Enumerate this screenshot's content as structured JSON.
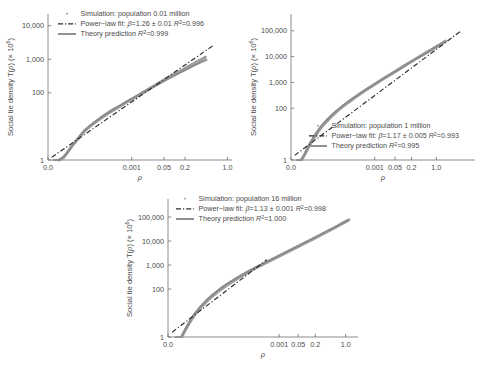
{
  "figure": {
    "background": "#ffffff",
    "series_color": "#8c8c8c",
    "fit_color": "#2b2b2b",
    "axis_color": "#6e6e6e"
  },
  "common": {
    "xlabel": "ρ",
    "ylabel_main": "Social tie density T(",
    "ylabel_rho": "ρ",
    "ylabel_tail": ") (× 10",
    "ylabel_exp": "6",
    "ylabel_close": ")",
    "xticks": [
      "0.0",
      "0.001",
      "0.05",
      "0.2",
      "1.0"
    ],
    "legend_sim_prefix": "Simulation: population ",
    "legend_fit_prefix": "Power−law fit: ",
    "legend_beta": "β",
    "legend_eq": "=",
    "legend_pm": " ± ",
    "legend_r2": "R",
    "legend_r2_sup": "2",
    "legend_theory_prefix": "Theory prediction "
  },
  "chart_data": [
    {
      "type": "line",
      "id": "panel-a",
      "title": "",
      "population_label": "0.01 million",
      "xlabel": "ρ",
      "ylabel": "Social tie density T(ρ) (× 10^6)",
      "xticks": [
        "0.0",
        "0.001",
        "0.05",
        "0.2",
        "1.0"
      ],
      "xtick_pos": [
        0.0,
        0.455,
        0.63,
        0.745,
        0.975
      ],
      "yticks": [
        "1",
        "100",
        "1,000",
        "10,000"
      ],
      "ytick_log": [
        0,
        2,
        3,
        4
      ],
      "ylim_log": [
        0,
        4.35
      ],
      "grid": false,
      "legend_position": "top-left",
      "legend": [
        {
          "marker": "dot",
          "label": "Simulation: population 0.01 million"
        },
        {
          "marker": "dashdot",
          "label": "Power−law fit: β=1.26 ± 0.01 R²=0.996"
        },
        {
          "marker": "solid",
          "label": "Theory prediction R²=0.999"
        }
      ],
      "fit": {
        "beta": "1.26",
        "beta_err": "0.01",
        "r2": "0.996"
      },
      "theory": {
        "r2": "0.999"
      },
      "series": [
        {
          "name": "Theory prediction",
          "style": "solid",
          "x": [
            0.055,
            0.07,
            0.09,
            0.11,
            0.13,
            0.16,
            0.195,
            0.23,
            0.27,
            0.31,
            0.35,
            0.395,
            0.44,
            0.49,
            0.545,
            0.6,
            0.655,
            0.7,
            0.745,
            0.79,
            0.83,
            0.862
          ],
          "y_log": [
            0.0,
            0.02,
            0.12,
            0.26,
            0.42,
            0.62,
            0.85,
            1.02,
            1.2,
            1.36,
            1.5,
            1.64,
            1.78,
            1.93,
            2.1,
            2.26,
            2.42,
            2.55,
            2.68,
            2.8,
            2.91,
            2.98
          ]
        },
        {
          "name": "Simulation",
          "style": "scatter-band",
          "x": [
            0.06,
            0.085,
            0.105,
            0.135,
            0.165,
            0.2,
            0.24,
            0.285,
            0.33,
            0.375,
            0.42,
            0.47,
            0.52,
            0.575,
            0.63,
            0.685,
            0.73,
            0.775,
            0.815,
            0.855
          ],
          "y_log": [
            0.0,
            0.08,
            0.22,
            0.45,
            0.65,
            0.88,
            1.06,
            1.24,
            1.4,
            1.55,
            1.7,
            1.86,
            2.02,
            2.2,
            2.38,
            2.55,
            2.68,
            2.82,
            2.94,
            3.06
          ]
        },
        {
          "name": "Power-law fit",
          "style": "dashdot",
          "x": [
            0.02,
            0.9
          ],
          "y_log": [
            0.08,
            3.42
          ]
        }
      ]
    },
    {
      "type": "line",
      "id": "panel-b",
      "title": "",
      "population_label": "1 million",
      "xlabel": "ρ",
      "ylabel": "Social tie density T(ρ) (× 10^6)",
      "xticks": [
        "0.0",
        "0.001",
        "0.05",
        "0.2",
        "1.0"
      ],
      "xtick_pos": [
        0.0,
        0.455,
        0.565,
        0.655,
        0.79
      ],
      "yticks": [
        "1",
        "100",
        "1,000",
        "10,000",
        "100,000"
      ],
      "ytick_log": [
        0,
        2,
        3,
        4,
        5
      ],
      "ylim_log": [
        0,
        5.65
      ],
      "grid": false,
      "legend_position": "bottom-right",
      "legend": [
        {
          "marker": "dot",
          "label": "Simulation: population 1 million"
        },
        {
          "marker": "dashdot",
          "label": "Power−law fit: β=1.17 ± 0.005 R²=0.993"
        },
        {
          "marker": "solid",
          "label": "Theory prediction R²=0.995"
        }
      ],
      "fit": {
        "beta": "1.17",
        "beta_err": "0.005",
        "r2": "0.993"
      },
      "theory": {
        "r2": "0.995"
      },
      "series": [
        {
          "name": "Theory prediction",
          "style": "solid",
          "x": [
            0.055,
            0.07,
            0.085,
            0.105,
            0.13,
            0.16,
            0.195,
            0.235,
            0.28,
            0.33,
            0.38,
            0.43,
            0.485,
            0.54,
            0.595,
            0.65,
            0.7,
            0.745,
            0.79,
            0.83
          ],
          "y_log": [
            0.0,
            0.15,
            0.4,
            0.68,
            0.98,
            1.28,
            1.56,
            1.83,
            2.1,
            2.36,
            2.6,
            2.83,
            3.07,
            3.31,
            3.55,
            3.79,
            4.0,
            4.19,
            4.38,
            4.55
          ]
        },
        {
          "name": "Simulation",
          "style": "scatter-band",
          "x": [
            0.058,
            0.075,
            0.095,
            0.118,
            0.145,
            0.178,
            0.215,
            0.258,
            0.305,
            0.355,
            0.405,
            0.458,
            0.512,
            0.568,
            0.622,
            0.675,
            0.722,
            0.768,
            0.808,
            0.84
          ],
          "y_log": [
            0.02,
            0.22,
            0.5,
            0.78,
            1.08,
            1.38,
            1.66,
            1.94,
            2.2,
            2.46,
            2.7,
            2.94,
            3.19,
            3.43,
            3.67,
            3.9,
            4.1,
            4.29,
            4.46,
            4.6
          ]
        },
        {
          "name": "Power-law fit",
          "style": "dashdot",
          "x": [
            0.02,
            0.925
          ],
          "y_log": [
            0.18,
            5.0
          ]
        }
      ]
    },
    {
      "type": "line",
      "id": "panel-c",
      "title": "",
      "population_label": "16 million",
      "xlabel": "ρ",
      "ylabel": "Social tie density T(ρ) (× 10^6)",
      "xticks": [
        "0.0",
        "0.001",
        "0.05",
        "0.2",
        "1.0"
      ],
      "xtick_pos": [
        0.0,
        0.585,
        0.685,
        0.775,
        0.935
      ],
      "yticks": [
        "1",
        "100",
        "1,000",
        "10,000",
        "100,000"
      ],
      "ytick_log": [
        0,
        2,
        3,
        4,
        5
      ],
      "ylim_log": [
        0,
        5.75
      ],
      "grid": false,
      "legend_position": "top-left",
      "legend": [
        {
          "marker": "dot",
          "label": "Simulation: population 16 million"
        },
        {
          "marker": "dashdot",
          "label": "Power−law fit: β=1.13 ± 0.001 R²=0.998"
        },
        {
          "marker": "solid",
          "label": "Theory prediction R²=1.000"
        }
      ],
      "fit": {
        "beta": "1.13",
        "beta_err": "0.001",
        "r2": "0.998"
      },
      "theory": {
        "r2": "1.000"
      },
      "series": [
        {
          "name": "Theory prediction",
          "style": "solid",
          "x": [
            0.072,
            0.09,
            0.11,
            0.135,
            0.165,
            0.2,
            0.24,
            0.285,
            0.335,
            0.39,
            0.445,
            0.5,
            0.56,
            0.62,
            0.68,
            0.74,
            0.8,
            0.855,
            0.905,
            0.945
          ],
          "y_log": [
            0.02,
            0.3,
            0.6,
            0.92,
            1.22,
            1.52,
            1.8,
            2.08,
            2.34,
            2.6,
            2.84,
            3.06,
            3.3,
            3.54,
            3.78,
            4.02,
            4.26,
            4.48,
            4.68,
            4.84
          ]
        },
        {
          "name": "Simulation",
          "style": "scatter-band",
          "x": [
            0.075,
            0.095,
            0.118,
            0.145,
            0.178,
            0.215,
            0.258,
            0.305,
            0.358,
            0.412,
            0.468,
            0.525,
            0.585,
            0.645,
            0.705,
            0.765,
            0.822,
            0.875,
            0.92,
            0.952
          ],
          "y_log": [
            0.05,
            0.35,
            0.66,
            0.98,
            1.28,
            1.58,
            1.86,
            2.14,
            2.4,
            2.66,
            2.9,
            3.13,
            3.37,
            3.61,
            3.85,
            4.09,
            4.33,
            4.55,
            4.74,
            4.88
          ]
        },
        {
          "name": "Power-law fit",
          "style": "dashdot",
          "x": [
            0.022,
            0.52
          ],
          "y_log": [
            0.2,
            3.22
          ]
        }
      ]
    }
  ]
}
